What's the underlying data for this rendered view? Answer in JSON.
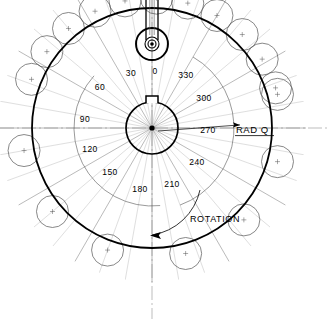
{
  "drawing": {
    "title": "Cam and roller-follower layout",
    "center": {
      "x": 152,
      "y": 128
    },
    "main_circle": {
      "radius": 120,
      "label": "cam-profile-circle"
    },
    "hub": {
      "radius": 26,
      "keyway_label": "keyway-notch"
    },
    "shaft": {
      "top_circle_radius": 16,
      "inner_radius": 5,
      "hub_dot_radius": 2.6
    }
  },
  "colors": {
    "ink": "#000000",
    "thin": "#555555",
    "construction": "#7a7a7a",
    "background": "#ffffff"
  },
  "angle_labels": [
    {
      "value": "0",
      "deg": 0,
      "x": 155,
      "y": 74
    },
    {
      "value": "30",
      "deg": 30,
      "x": 131,
      "y": 76
    },
    {
      "value": "60",
      "deg": 60,
      "x": 100,
      "y": 90
    },
    {
      "value": "90",
      "deg": 90,
      "x": 85,
      "y": 122
    },
    {
      "value": "120",
      "deg": 120,
      "x": 90,
      "y": 152
    },
    {
      "value": "150",
      "deg": 150,
      "x": 110,
      "y": 175
    },
    {
      "value": "180",
      "deg": 180,
      "x": 140,
      "y": 192
    },
    {
      "value": "210",
      "deg": 210,
      "x": 172,
      "y": 187
    },
    {
      "value": "240",
      "deg": 240,
      "x": 197,
      "y": 165
    },
    {
      "value": "270",
      "deg": 270,
      "x": 208,
      "y": 133
    },
    {
      "value": "300",
      "deg": 300,
      "x": 204,
      "y": 101
    },
    {
      "value": "330",
      "deg": 330,
      "x": 186,
      "y": 78
    }
  ],
  "annotations": {
    "rad_q": {
      "text": "RAD Q",
      "x": 236,
      "y": 133,
      "underlined": true
    },
    "rotation": {
      "text": "ROTATION",
      "x": 215,
      "y": 222,
      "direction": "counterclockwise"
    }
  },
  "rollers": {
    "count": 22,
    "radius": 16,
    "description": "roller follower circles tangent around cam profile"
  }
}
